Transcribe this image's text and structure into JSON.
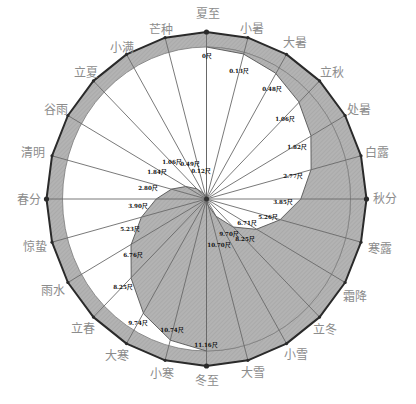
{
  "diagram": {
    "max_shadow": 11.16,
    "unit": "尺",
    "colors": {
      "shade": "#b3b3b3",
      "hatch": "#9e9e9e",
      "outline": "#2a2a2a",
      "spoke": "#6a6a6a",
      "inner_ring": "#7a7a7a",
      "term_text": "#8c8c8c",
      "value_text": "#111111"
    },
    "terms": [
      {
        "name": "夏至",
        "shadow": 0,
        "shadow_label": "0尺"
      },
      {
        "name": "小暑",
        "shadow": 0.13,
        "shadow_label": "0.13尺"
      },
      {
        "name": "大暑",
        "shadow": 0.48,
        "shadow_label": "0.48尺"
      },
      {
        "name": "立秋",
        "shadow": 1.06,
        "shadow_label": "1.06尺"
      },
      {
        "name": "处暑",
        "shadow": 1.82,
        "shadow_label": "1.82尺"
      },
      {
        "name": "白露",
        "shadow": 2.77,
        "shadow_label": "2.77尺"
      },
      {
        "name": "秋分",
        "shadow": 3.85,
        "shadow_label": "3.85尺"
      },
      {
        "name": "寒露",
        "shadow": 5.26,
        "shadow_label": "5.26尺"
      },
      {
        "name": "霜降",
        "shadow": 6.71,
        "shadow_label": "6.71尺"
      },
      {
        "name": "立冬",
        "shadow": 8.25,
        "shadow_label": "8.25尺"
      },
      {
        "name": "小雪",
        "shadow": 9.7,
        "shadow_label": "9.70尺"
      },
      {
        "name": "大雪",
        "shadow": 10.7,
        "shadow_label": "10.70尺"
      },
      {
        "name": "冬至",
        "shadow": 11.16,
        "shadow_label": "11.16尺"
      },
      {
        "name": "小寒",
        "shadow": 10.74,
        "shadow_label": "10.74尺"
      },
      {
        "name": "大寒",
        "shadow": 9.74,
        "shadow_label": "9.74尺"
      },
      {
        "name": "立春",
        "shadow": 8.25,
        "shadow_label": "8.25尺"
      },
      {
        "name": "雨水",
        "shadow": 6.76,
        "shadow_label": "6.76尺"
      },
      {
        "name": "惊蛰",
        "shadow": 5.23,
        "shadow_label": "5.23尺"
      },
      {
        "name": "春分",
        "shadow": 3.9,
        "shadow_label": "3.90尺"
      },
      {
        "name": "清明",
        "shadow": 2.8,
        "shadow_label": "2.80尺"
      },
      {
        "name": "谷雨",
        "shadow": 1.84,
        "shadow_label": "1.84尺"
      },
      {
        "name": "立夏",
        "shadow": 1.06,
        "shadow_label": "1.06尺"
      },
      {
        "name": "小满",
        "shadow": 0.49,
        "shadow_label": "0.49尺"
      },
      {
        "name": "芒种",
        "shadow": 0.12,
        "shadow_label": "0.12尺"
      }
    ]
  }
}
